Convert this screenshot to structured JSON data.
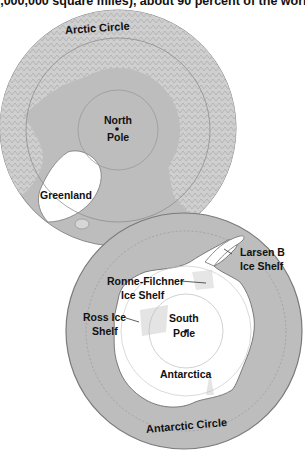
{
  "header": {
    "text": "(,000,000 square miles), about 90 percent of the world."
  },
  "arctic_map": {
    "circle_label": "Arctic Circle",
    "pole_label_line1": "North",
    "pole_label_line2": "Pole",
    "landmass_label": "Greenland"
  },
  "antarctic_map": {
    "circle_label": "Antarctic Circle",
    "pole_label_line1": "South",
    "pole_label_line2": "Pole",
    "continent_label": "Antarctica",
    "ice_shelves": [
      {
        "line1": "Larsen B",
        "line2": "Ice Shelf"
      },
      {
        "line1": "Ronne-Filchner",
        "line2": "Ice Shelf"
      },
      {
        "line1": "Ross Ice",
        "line2": "Shelf"
      }
    ]
  },
  "colors": {
    "ocean": "#b9b9b9",
    "land": "#d6d6d6",
    "ice": "#ffffff",
    "outline": "#888888",
    "text": "#111111"
  }
}
